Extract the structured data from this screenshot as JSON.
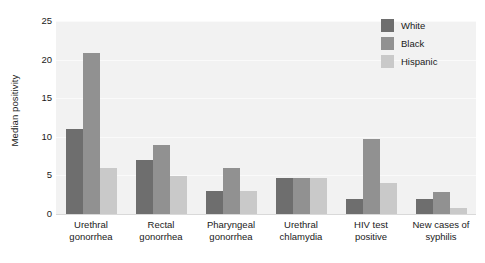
{
  "chart_data": {
    "type": "bar",
    "title": "",
    "subtitle": "",
    "xlabel": "",
    "ylabel": "Median positivity",
    "ylim": [
      0,
      25
    ],
    "yticks": [
      0,
      5,
      10,
      15,
      20,
      25
    ],
    "ytick_labels": [
      "0",
      "5",
      "10",
      "15",
      "20",
      "25"
    ],
    "grid": true,
    "grid_axis": "y",
    "legend_position": "top-right",
    "plot_background": "#f2f2f2",
    "categories": [
      "Urethral gonorrhea",
      "Rectal gonorrhea",
      "Pharyngeal gonorrhea",
      "Urethral chlamydia",
      "HIV test positive",
      "New cases of syphilis"
    ],
    "category_lines": [
      [
        "Urethral",
        "gonorrhea"
      ],
      [
        "Rectal",
        "gonorrhea"
      ],
      [
        "Pharyngeal",
        "gonorrhea"
      ],
      [
        "Urethral",
        "chlamydia"
      ],
      [
        "HIV test",
        "positive"
      ],
      [
        "New cases of",
        "syphilis"
      ]
    ],
    "series": [
      {
        "name": "White",
        "color": "#6e6e6e",
        "values": [
          11,
          7,
          3,
          4.7,
          2,
          2
        ]
      },
      {
        "name": "Black",
        "color": "#919191",
        "values": [
          20.9,
          8.9,
          6,
          4.7,
          9.7,
          2.9
        ]
      },
      {
        "name": "Hispanic",
        "color": "#c9c9c9",
        "values": [
          6,
          4.9,
          3,
          4.7,
          4,
          0.8
        ]
      }
    ]
  }
}
